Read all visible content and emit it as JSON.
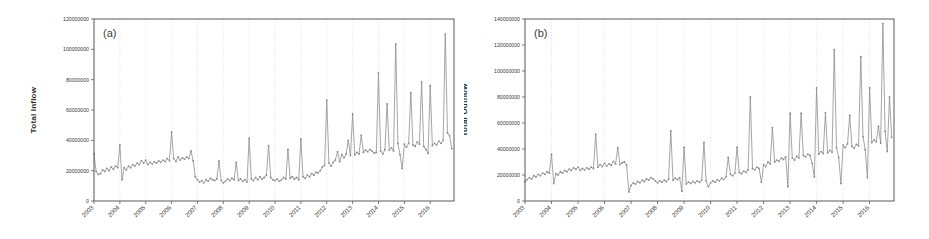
{
  "figure": {
    "background_color": "#ffffff",
    "line_color": "#8e8e8e",
    "grid_color": "#c9c9c9",
    "axis_color": "#5a5a5a"
  },
  "panels": [
    {
      "tag": "(a)",
      "ylabel": "Total Inflow",
      "xlabel": ""
    },
    {
      "tag": "(b)",
      "ylabel": "Total Outflow",
      "xlabel": ""
    }
  ],
  "chart_data": [
    {
      "type": "line",
      "title": "(a)",
      "xlabel": "",
      "ylabel": "Total Inflow",
      "xlim": [
        2003.0,
        2016.92
      ],
      "ylim": [
        0,
        120000000
      ],
      "yticks": [
        0,
        20000000,
        40000000,
        60000000,
        80000000,
        100000000,
        120000000
      ],
      "ytick_labels": [
        "0",
        "20000000",
        "40000000",
        "60000000",
        "80000000",
        "100000000",
        "120000000"
      ],
      "xticks": [
        2003,
        2004,
        2005,
        2006,
        2007,
        2008,
        2009,
        2010,
        2011,
        2012,
        2013,
        2014,
        2015,
        2016
      ],
      "xtick_labels": [
        "2003",
        "2004",
        "2005",
        "2006",
        "2007",
        "2008",
        "2009",
        "2010",
        "2011",
        "2012",
        "2013",
        "2014",
        "2015",
        "2016"
      ],
      "grid": "vertical-dotted",
      "legend": null,
      "marker": "circle",
      "series": [
        {
          "name": "Total Inflow",
          "x": [
            2003.0,
            2003.083,
            2003.167,
            2003.25,
            2003.333,
            2003.417,
            2003.5,
            2003.583,
            2003.667,
            2003.75,
            2003.833,
            2003.917,
            2004.0,
            2004.083,
            2004.167,
            2004.25,
            2004.333,
            2004.417,
            2004.5,
            2004.583,
            2004.667,
            2004.75,
            2004.833,
            2004.917,
            2005.0,
            2005.083,
            2005.167,
            2005.25,
            2005.333,
            2005.417,
            2005.5,
            2005.583,
            2005.667,
            2005.75,
            2005.833,
            2005.917,
            2006.0,
            2006.083,
            2006.167,
            2006.25,
            2006.333,
            2006.417,
            2006.5,
            2006.583,
            2006.667,
            2006.75,
            2006.833,
            2006.917,
            2007.0,
            2007.083,
            2007.167,
            2007.25,
            2007.333,
            2007.417,
            2007.5,
            2007.583,
            2007.667,
            2007.75,
            2007.833,
            2007.917,
            2008.0,
            2008.083,
            2008.167,
            2008.25,
            2008.333,
            2008.417,
            2008.5,
            2008.583,
            2008.667,
            2008.75,
            2008.833,
            2008.917,
            2009.0,
            2009.083,
            2009.167,
            2009.25,
            2009.333,
            2009.417,
            2009.5,
            2009.583,
            2009.667,
            2009.75,
            2009.833,
            2009.917,
            2010.0,
            2010.083,
            2010.167,
            2010.25,
            2010.333,
            2010.417,
            2010.5,
            2010.583,
            2010.667,
            2010.75,
            2010.833,
            2010.917,
            2011.0,
            2011.083,
            2011.167,
            2011.25,
            2011.333,
            2011.417,
            2011.5,
            2011.583,
            2011.667,
            2011.75,
            2011.833,
            2011.917,
            2012.0,
            2012.083,
            2012.167,
            2012.25,
            2012.333,
            2012.417,
            2012.5,
            2012.583,
            2012.667,
            2012.75,
            2012.833,
            2012.917,
            2013.0,
            2013.083,
            2013.167,
            2013.25,
            2013.333,
            2013.417,
            2013.5,
            2013.583,
            2013.667,
            2013.75,
            2013.833,
            2013.917,
            2014.0,
            2014.083,
            2014.167,
            2014.25,
            2014.333,
            2014.417,
            2014.5,
            2014.583,
            2014.667,
            2014.75,
            2014.833,
            2014.917,
            2015.0,
            2015.083,
            2015.167,
            2015.25,
            2015.333,
            2015.417,
            2015.5,
            2015.583,
            2015.667,
            2015.75,
            2015.833,
            2015.917,
            2016.0,
            2016.083,
            2016.167,
            2016.25,
            2016.333,
            2016.417,
            2016.5,
            2016.583,
            2016.667,
            2016.75,
            2016.833
          ],
          "values": [
            31000000,
            19500000,
            17500000,
            18000000,
            20500000,
            19500000,
            21500000,
            20000000,
            22500000,
            21000000,
            23000000,
            22000000,
            37000000,
            14000000,
            22000000,
            20500000,
            23000000,
            22000000,
            24000000,
            23000000,
            25000000,
            24000000,
            26500000,
            25000000,
            27000000,
            24000000,
            25500000,
            24500000,
            26000000,
            25000000,
            26500000,
            25500000,
            27000000,
            26000000,
            28000000,
            26500000,
            45500000,
            28000000,
            26000000,
            29000000,
            27000000,
            28500000,
            27500000,
            29000000,
            28000000,
            33000000,
            26500000,
            16000000,
            14000000,
            12500000,
            13500000,
            12000000,
            14000000,
            13000000,
            15000000,
            14000000,
            13500000,
            14500000,
            26500000,
            13500000,
            12000000,
            13000000,
            14500000,
            13500000,
            15000000,
            14000000,
            25500000,
            13500000,
            14500000,
            13000000,
            14000000,
            12500000,
            41500000,
            14500000,
            13500000,
            15500000,
            14000000,
            16000000,
            14500000,
            15500000,
            17000000,
            36500000,
            15500000,
            14000000,
            13500000,
            14500000,
            13000000,
            14000000,
            15500000,
            14500000,
            34000000,
            15000000,
            16000000,
            14500000,
            15500000,
            14000000,
            41000000,
            16000000,
            15000000,
            17000000,
            16000000,
            18000000,
            17000000,
            19000000,
            18500000,
            20000000,
            22500000,
            23500000,
            66500000,
            25000000,
            23000000,
            25500000,
            27000000,
            32500000,
            26000000,
            30500000,
            28500000,
            31000000,
            40000000,
            30000000,
            57500000,
            30500000,
            32000000,
            31000000,
            43500000,
            32000000,
            33500000,
            32500000,
            34000000,
            33000000,
            31500000,
            32000000,
            84500000,
            33000000,
            31000000,
            34000000,
            64000000,
            33500000,
            35000000,
            33000000,
            103500000,
            38000000,
            30500000,
            21500000,
            37500000,
            35500000,
            38000000,
            71500000,
            37000000,
            36000000,
            39000000,
            37500000,
            78500000,
            36000000,
            34000000,
            31500000,
            76000000,
            36500000,
            38000000,
            37000000,
            39500000,
            38000000,
            40000000,
            110000000,
            45000000,
            43000000,
            34500000
          ]
        }
      ]
    },
    {
      "type": "line",
      "title": "(b)",
      "xlabel": "",
      "ylabel": "Total Outflow",
      "xlim": [
        2003.0,
        2016.92
      ],
      "ylim": [
        0,
        140000000
      ],
      "yticks": [
        0,
        20000000,
        40000000,
        60000000,
        80000000,
        100000000,
        120000000,
        140000000
      ],
      "ytick_labels": [
        "0",
        "20000000",
        "40000000",
        "60000000",
        "80000000",
        "100000000",
        "120000000",
        "140000000"
      ],
      "xticks": [
        2003,
        2004,
        2005,
        2006,
        2007,
        2008,
        2009,
        2010,
        2011,
        2012,
        2013,
        2014,
        2015,
        2016
      ],
      "xtick_labels": [
        "2003",
        "2004",
        "2005",
        "2006",
        "2007",
        "2008",
        "2009",
        "2010",
        "2011",
        "2012",
        "2013",
        "2014",
        "2015",
        "2016"
      ],
      "grid": "vertical-dotted",
      "legend": null,
      "marker": "circle",
      "series": [
        {
          "name": "Total Outflow",
          "x": [
            2003.0,
            2003.083,
            2003.167,
            2003.25,
            2003.333,
            2003.417,
            2003.5,
            2003.583,
            2003.667,
            2003.75,
            2003.833,
            2003.917,
            2004.0,
            2004.083,
            2004.167,
            2004.25,
            2004.333,
            2004.417,
            2004.5,
            2004.583,
            2004.667,
            2004.75,
            2004.833,
            2004.917,
            2005.0,
            2005.083,
            2005.167,
            2005.25,
            2005.333,
            2005.417,
            2005.5,
            2005.583,
            2005.667,
            2005.75,
            2005.833,
            2005.917,
            2006.0,
            2006.083,
            2006.167,
            2006.25,
            2006.333,
            2006.417,
            2006.5,
            2006.583,
            2006.667,
            2006.75,
            2006.833,
            2006.917,
            2007.0,
            2007.083,
            2007.167,
            2007.25,
            2007.333,
            2007.417,
            2007.5,
            2007.583,
            2007.667,
            2007.75,
            2007.833,
            2007.917,
            2008.0,
            2008.083,
            2008.167,
            2008.25,
            2008.333,
            2008.417,
            2008.5,
            2008.583,
            2008.667,
            2008.75,
            2008.833,
            2008.917,
            2009.0,
            2009.083,
            2009.167,
            2009.25,
            2009.333,
            2009.417,
            2009.5,
            2009.583,
            2009.667,
            2009.75,
            2009.833,
            2009.917,
            2010.0,
            2010.083,
            2010.167,
            2010.25,
            2010.333,
            2010.417,
            2010.5,
            2010.583,
            2010.667,
            2010.75,
            2010.833,
            2010.917,
            2011.0,
            2011.083,
            2011.167,
            2011.25,
            2011.333,
            2011.417,
            2011.5,
            2011.583,
            2011.667,
            2011.75,
            2011.833,
            2011.917,
            2012.0,
            2012.083,
            2012.167,
            2012.25,
            2012.333,
            2012.417,
            2012.5,
            2012.583,
            2012.667,
            2012.75,
            2012.833,
            2012.917,
            2013.0,
            2013.083,
            2013.167,
            2013.25,
            2013.333,
            2013.417,
            2013.5,
            2013.583,
            2013.667,
            2013.75,
            2013.833,
            2013.917,
            2014.0,
            2014.083,
            2014.167,
            2014.25,
            2014.333,
            2014.417,
            2014.5,
            2014.583,
            2014.667,
            2014.75,
            2014.833,
            2014.917,
            2015.0,
            2015.083,
            2015.167,
            2015.25,
            2015.333,
            2015.417,
            2015.5,
            2015.583,
            2015.667,
            2015.75,
            2015.833,
            2015.917,
            2016.0,
            2016.083,
            2016.167,
            2016.25,
            2016.333,
            2016.417,
            2016.5,
            2016.583,
            2016.667,
            2016.75,
            2016.833
          ],
          "values": [
            15000000,
            16500000,
            18000000,
            17000000,
            19500000,
            18500000,
            20500000,
            19500000,
            21500000,
            20500000,
            22500000,
            21500000,
            36000000,
            13500000,
            21000000,
            20000000,
            22500000,
            21500000,
            23500000,
            22500000,
            24500000,
            23500000,
            25500000,
            24500000,
            26000000,
            23500000,
            25000000,
            24000000,
            25500000,
            24500000,
            26000000,
            25000000,
            51500000,
            26000000,
            28000000,
            26500000,
            29000000,
            27000000,
            28500000,
            27500000,
            30500000,
            28500000,
            41000000,
            28000000,
            29500000,
            30000000,
            27500000,
            7000000,
            12000000,
            14000000,
            13000000,
            15000000,
            14000000,
            16000000,
            15000000,
            17000000,
            16000000,
            18000000,
            17000000,
            15500000,
            14000000,
            15500000,
            14500000,
            16000000,
            15000000,
            17000000,
            54000000,
            16000000,
            17500000,
            16500000,
            18000000,
            7500000,
            41500000,
            13000000,
            14500000,
            13500000,
            15000000,
            14000000,
            15500000,
            14500000,
            16000000,
            45000000,
            15500000,
            11000000,
            14000000,
            15500000,
            14500000,
            16500000,
            15500000,
            17500000,
            16500000,
            18500000,
            33500000,
            20500000,
            19500000,
            21500000,
            41500000,
            22000000,
            21000000,
            23000000,
            22000000,
            24000000,
            80000000,
            25000000,
            24000000,
            26000000,
            25000000,
            14500000,
            28000000,
            26500000,
            30000000,
            28500000,
            56500000,
            30000000,
            31500000,
            30500000,
            33000000,
            32000000,
            34000000,
            11000000,
            67500000,
            33000000,
            31500000,
            34500000,
            33000000,
            67500000,
            35000000,
            34000000,
            36000000,
            35000000,
            29000000,
            18500000,
            87000000,
            36000000,
            38000000,
            36500000,
            68000000,
            37000000,
            39000000,
            37500000,
            116500000,
            41000000,
            33500000,
            13500000,
            43000000,
            41000000,
            44000000,
            66000000,
            42000000,
            40500000,
            43500000,
            42500000,
            111000000,
            49500000,
            39500000,
            18000000,
            87000000,
            45000000,
            47000000,
            45500000,
            57500000,
            44500000,
            136500000,
            53500000,
            38000000,
            80000000,
            49000000
          ]
        }
      ]
    }
  ]
}
